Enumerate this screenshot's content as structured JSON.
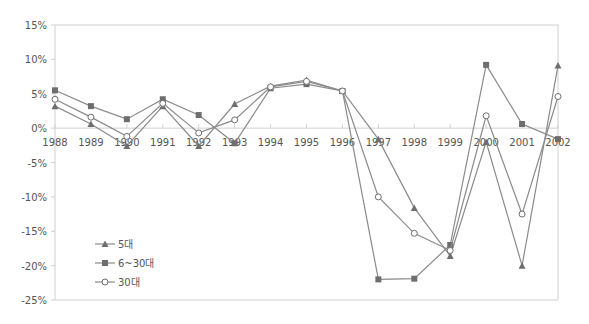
{
  "chart_data": {
    "type": "line",
    "title": "",
    "xlabel": "",
    "ylabel": "",
    "x": [
      "1988",
      "1989",
      "1990",
      "1991",
      "1992",
      "1993",
      "1994",
      "1995",
      "1996",
      "1997",
      "1998",
      "1999",
      "2000",
      "2001",
      "2002"
    ],
    "ylim": [
      -25,
      15
    ],
    "yticks": [
      15,
      10,
      5,
      0,
      -5,
      -10,
      -15,
      -20,
      -25
    ],
    "ytick_labels": [
      "15%",
      "10%",
      "5%",
      "0%",
      "-5%",
      "-10%",
      "-15%",
      "-20%",
      "-25%"
    ],
    "grid": false,
    "legend_position": "lower-left inside",
    "series": [
      {
        "name": "5대",
        "marker": "triangle",
        "values": [
          3.2,
          0.6,
          -2.6,
          3.2,
          -2.6,
          3.5,
          6.1,
          7.0,
          5.4,
          -1.6,
          -11.6,
          -18.6,
          -2.0,
          -20.0,
          9.1
        ]
      },
      {
        "name": "6~30대",
        "marker": "square",
        "values": [
          5.5,
          3.2,
          1.3,
          4.2,
          1.9,
          -2.2,
          5.8,
          6.4,
          5.4,
          -22.0,
          -21.9,
          -17.0,
          9.2,
          0.6,
          -1.6
        ]
      },
      {
        "name": "30대",
        "marker": "circle",
        "values": [
          4.2,
          1.6,
          -1.2,
          3.6,
          -0.7,
          1.2,
          6.0,
          6.8,
          5.4,
          -10.0,
          -15.3,
          -17.8,
          1.8,
          -12.5,
          4.6
        ]
      }
    ]
  },
  "colors": {
    "line": "#8a8a8a",
    "marker": "#6e6e6e",
    "axis": "#d0d0d0",
    "text": "#555555"
  }
}
